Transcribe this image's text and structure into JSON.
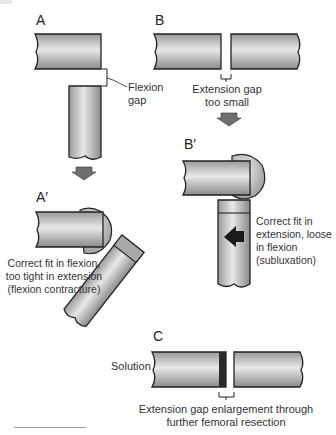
{
  "panels": {
    "A": {
      "label": "A",
      "annotation": "Flexion\ngap",
      "annotation_lines": [
        "Flexion",
        "gap"
      ]
    },
    "B": {
      "label": "B",
      "annotation_lines": [
        "Extension gap",
        "too small"
      ]
    },
    "A_prime": {
      "label": "A′",
      "annotation_lines": [
        "Correct fit in flexion,",
        "too tight in extension",
        "(flexion contracture)"
      ]
    },
    "B_prime": {
      "label": "B′",
      "annotation_lines": [
        "Correct fit in",
        "extension, loose",
        "in flexion",
        "(subluxation)"
      ]
    },
    "C": {
      "label": "C",
      "side_label": "Solution",
      "annotation_lines": [
        "Extension gap enlargement through",
        "further femoral resection"
      ]
    }
  },
  "colors": {
    "bone_light": "#e6e6e6",
    "bone_mid": "#bdbdbd",
    "bone_dark": "#8c8c8c",
    "outline": "#222222",
    "arrow": "#6e6e6e",
    "resection": "#2a2a2a"
  }
}
